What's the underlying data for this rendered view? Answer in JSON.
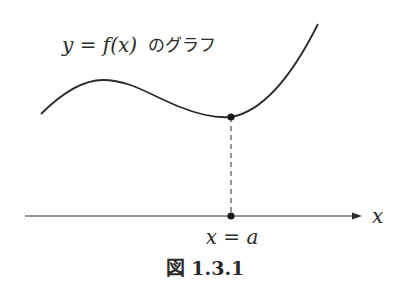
{
  "figure": {
    "graph_label_math": "y = f(x)",
    "graph_label_jp": "のグラフ",
    "axis_label": "x",
    "point_label": "x = a",
    "caption": "図 1.3.1"
  },
  "colors": {
    "ink": "#2a2a2a",
    "background": "#ffffff"
  }
}
